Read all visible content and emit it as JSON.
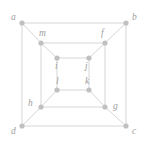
{
  "figure": {
    "type": "graph-diagram",
    "width": 146,
    "height": 144,
    "background_color": "#ffffff",
    "edge_color": "#d6d6d6",
    "vertex_color": "#c0c0c0",
    "label_color": "#9e9e9e"
  },
  "vertices": [
    {
      "id": "a",
      "label": "a",
      "x": 22,
      "y": 23,
      "label_x": 11,
      "label_y": 13,
      "ring": "outer"
    },
    {
      "id": "b",
      "label": "b",
      "x": 126,
      "y": 23,
      "label_x": 132,
      "label_y": 13,
      "ring": "outer"
    },
    {
      "id": "c",
      "label": "c",
      "x": 126,
      "y": 126,
      "label_x": 132,
      "label_y": 127,
      "ring": "outer"
    },
    {
      "id": "d",
      "label": "d",
      "x": 22,
      "y": 126,
      "label_x": 11,
      "label_y": 127,
      "ring": "outer"
    },
    {
      "id": "m",
      "label": "m",
      "x": 41,
      "y": 43,
      "label_x": 39,
      "label_y": 29,
      "ring": "middle"
    },
    {
      "id": "f",
      "label": "f",
      "x": 105,
      "y": 43,
      "label_x": 101,
      "label_y": 29,
      "ring": "middle"
    },
    {
      "id": "g",
      "label": "g",
      "x": 105,
      "y": 107,
      "label_x": 113,
      "label_y": 102,
      "ring": "middle"
    },
    {
      "id": "h",
      "label": "h",
      "x": 41,
      "y": 107,
      "label_x": 28,
      "label_y": 99,
      "ring": "middle"
    },
    {
      "id": "i",
      "label": "i",
      "x": 57,
      "y": 58,
      "label_x": 55,
      "label_y": 62,
      "ring": "inner"
    },
    {
      "id": "j",
      "label": "j",
      "x": 89,
      "y": 58,
      "label_x": 85,
      "label_y": 62,
      "ring": "inner"
    },
    {
      "id": "k",
      "label": "k",
      "x": 89,
      "y": 90,
      "label_x": 85,
      "label_y": 77,
      "ring": "inner"
    },
    {
      "id": "l",
      "label": "l",
      "x": 57,
      "y": 90,
      "label_x": 56,
      "label_y": 77,
      "ring": "inner"
    }
  ],
  "edges": [
    {
      "from": "a",
      "to": "b",
      "kind": "outer-square"
    },
    {
      "from": "b",
      "to": "c",
      "kind": "outer-square"
    },
    {
      "from": "c",
      "to": "d",
      "kind": "outer-square"
    },
    {
      "from": "d",
      "to": "a",
      "kind": "outer-square"
    },
    {
      "from": "m",
      "to": "f",
      "kind": "middle-square"
    },
    {
      "from": "f",
      "to": "g",
      "kind": "middle-square"
    },
    {
      "from": "g",
      "to": "h",
      "kind": "middle-square"
    },
    {
      "from": "h",
      "to": "m",
      "kind": "middle-square"
    },
    {
      "from": "i",
      "to": "j",
      "kind": "inner-square"
    },
    {
      "from": "j",
      "to": "k",
      "kind": "inner-square"
    },
    {
      "from": "k",
      "to": "l",
      "kind": "inner-square"
    },
    {
      "from": "l",
      "to": "i",
      "kind": "inner-square"
    },
    {
      "from": "a",
      "to": "m",
      "kind": "diagonal"
    },
    {
      "from": "b",
      "to": "f",
      "kind": "diagonal"
    },
    {
      "from": "c",
      "to": "g",
      "kind": "diagonal"
    },
    {
      "from": "d",
      "to": "h",
      "kind": "diagonal"
    },
    {
      "from": "m",
      "to": "i",
      "kind": "diagonal"
    },
    {
      "from": "f",
      "to": "j",
      "kind": "diagonal"
    },
    {
      "from": "g",
      "to": "k",
      "kind": "diagonal"
    },
    {
      "from": "h",
      "to": "l",
      "kind": "diagonal"
    }
  ]
}
